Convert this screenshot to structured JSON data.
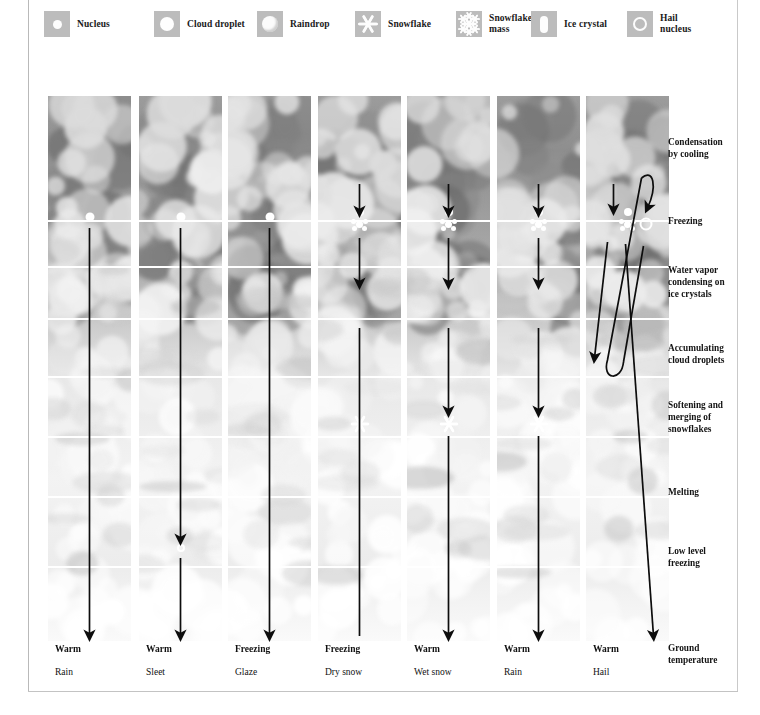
{
  "legend": {
    "items": [
      {
        "id": "nucleus",
        "label": "Nucleus",
        "icon": "nucleus-icon",
        "x": 0
      },
      {
        "id": "cloud-droplet",
        "label": "Cloud droplet",
        "icon": "cloud-droplet-icon",
        "x": 110
      },
      {
        "id": "raindrop",
        "label": "Raindrop",
        "icon": "raindrop-icon",
        "x": 213
      },
      {
        "id": "snowflake",
        "label": "Snowflake",
        "icon": "snowflake-icon",
        "x": 311
      },
      {
        "id": "snowflake-mass",
        "label": "Snowflake\nmass",
        "icon": "snowflake-mass-icon",
        "x": 412
      },
      {
        "id": "ice-crystal",
        "label": "Ice crystal",
        "icon": "ice-crystal-icon",
        "x": 487
      },
      {
        "id": "hail-nucleus",
        "label": "Hail nucleus",
        "icon": "hail-nucleus-icon",
        "x": 583
      }
    ]
  },
  "stages": [
    {
      "id": "condensation",
      "label": "Condensation\nby cooling",
      "y": 137
    },
    {
      "id": "freezing",
      "label": "Freezing",
      "y": 216
    },
    {
      "id": "water-vapor",
      "label": "Water vapor\ncondensing on\nice crystals",
      "y": 265
    },
    {
      "id": "accumulating",
      "label": "Accumulating\ncloud droplets",
      "y": 343
    },
    {
      "id": "softening",
      "label": "Softening and\nmerging of\nsnowflakes",
      "y": 400
    },
    {
      "id": "melting",
      "label": "Melting",
      "y": 487
    },
    {
      "id": "low-freezing",
      "label": "Low level\nfreezing",
      "y": 546
    },
    {
      "id": "ground-temp",
      "label": "Ground\ntemperature",
      "y": 643
    }
  ],
  "band_positions": {
    "freezing": 124,
    "vapor": 170,
    "accumulating": 222,
    "softening": 280,
    "melting": 340,
    "low_freezing": 400,
    "ground": 470
  },
  "columns": [
    {
      "id": "rain",
      "caption": "Rain",
      "ground_temp": "Warm",
      "x": 48,
      "type": "rain"
    },
    {
      "id": "sleet",
      "caption": "Sleet",
      "ground_temp": "Warm",
      "x": 139,
      "type": "sleet"
    },
    {
      "id": "glaze",
      "caption": "Glaze",
      "ground_temp": "Freezing",
      "x": 228,
      "type": "glaze"
    },
    {
      "id": "dry-snow",
      "caption": "Dry snow",
      "ground_temp": "Freezing",
      "x": 318,
      "type": "dry-snow"
    },
    {
      "id": "wet-snow",
      "caption": "Wet snow",
      "ground_temp": "Warm",
      "x": 407,
      "type": "wet-snow"
    },
    {
      "id": "rain-2",
      "caption": "Rain",
      "ground_temp": "Warm",
      "x": 497,
      "type": "rain-melt"
    },
    {
      "id": "hail",
      "caption": "Hail",
      "ground_temp": "Warm",
      "x": 586,
      "type": "hail"
    }
  ],
  "colors": {
    "swatch": "#bcbcbc",
    "arrow": "#0d0d0d",
    "particle": "#ffffff",
    "band": "#ffffff",
    "frame": "#c0c0c0",
    "text": "#111111"
  }
}
